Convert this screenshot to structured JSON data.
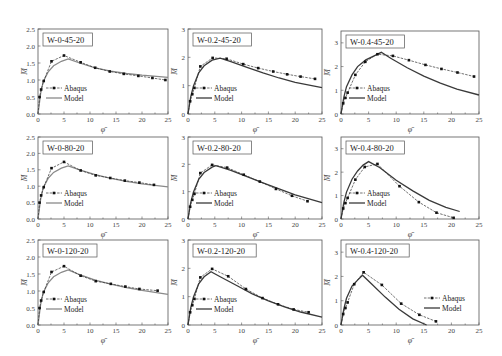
{
  "figure": {
    "legend": {
      "abaqus_label": "Abaqus",
      "model_label": "Model"
    },
    "xlabel": "φ̄",
    "ylabel": "M̄",
    "colors": {
      "abaqus": "#222222",
      "model_light": "#8a8a8a",
      "model_dark": "#3a3a3a",
      "frame": "#555555"
    }
  },
  "chart_data": [
    {
      "type": "line",
      "title": "W-0-45-20",
      "xlabel": "φ̄",
      "ylabel": "M̄",
      "xlim": [
        0,
        25
      ],
      "ylim": [
        0,
        2.5
      ],
      "xticks": [
        0,
        5,
        10,
        15,
        20,
        25
      ],
      "yticks": [
        0.0,
        0.5,
        1.0,
        1.5,
        2.0,
        2.5
      ],
      "ytick_labels": [
        "0.0",
        "0.5",
        "1.0",
        "1.5",
        "2.0",
        "2.5"
      ],
      "frame": [
        38,
        29,
        168,
        114
      ],
      "legend_pos": "lower-left",
      "model_style": "light",
      "series": [
        {
          "name": "Abaqus",
          "x": [
            0,
            0.3,
            0.6,
            1.1,
            2.6,
            5.0,
            8.2,
            11.0,
            13.8,
            16.5,
            19.3,
            22.0,
            24.5
          ],
          "y": [
            0,
            0.5,
            0.72,
            0.97,
            1.55,
            1.72,
            1.52,
            1.36,
            1.25,
            1.18,
            1.12,
            1.06,
            1.0
          ]
        },
        {
          "name": "Model",
          "x": [
            0,
            0.5,
            1.0,
            2.0,
            3.0,
            4.5,
            5.8,
            8.0,
            11.0,
            14.0,
            17.0,
            20.0,
            25.0
          ],
          "y": [
            0,
            0.6,
            0.95,
            1.25,
            1.42,
            1.55,
            1.62,
            1.5,
            1.36,
            1.26,
            1.19,
            1.14,
            1.08
          ]
        }
      ]
    },
    {
      "type": "line",
      "title": "W-0.2-45-20",
      "xlabel": "φ̄",
      "ylabel": "M̄",
      "xlim": [
        0,
        25
      ],
      "ylim": [
        0,
        3
      ],
      "xticks": [
        0,
        5,
        10,
        15,
        20,
        25
      ],
      "yticks": [
        0,
        1,
        2,
        3
      ],
      "ytick_labels": [
        "0",
        "1",
        "2",
        "3"
      ],
      "frame": [
        188,
        29,
        322,
        114
      ],
      "legend_pos": "lower-left",
      "model_style": "dark",
      "series": [
        {
          "name": "Abaqus",
          "x": [
            0,
            0.4,
            0.8,
            1.2,
            2.3,
            4.6,
            7.2,
            10.3,
            13.1,
            15.9,
            18.5,
            21.0,
            23.7
          ],
          "y": [
            0,
            0.45,
            0.7,
            0.92,
            1.68,
            1.98,
            1.95,
            1.76,
            1.62,
            1.5,
            1.4,
            1.32,
            1.24
          ]
        },
        {
          "name": "Model",
          "x": [
            0,
            0.5,
            1.0,
            2.0,
            3.0,
            4.5,
            6.0,
            8.0,
            11.0,
            14.0,
            17.0,
            20.0,
            25.0
          ],
          "y": [
            0,
            0.6,
            0.98,
            1.45,
            1.7,
            1.9,
            1.97,
            1.85,
            1.65,
            1.45,
            1.27,
            1.12,
            0.93
          ]
        }
      ]
    },
    {
      "type": "line",
      "title": "W-0.4-45-20",
      "xlabel": "φ̄",
      "ylabel": "M̄",
      "xlim": [
        0,
        25
      ],
      "ylim": [
        0,
        3.5
      ],
      "xticks": [
        0,
        5,
        10,
        15,
        20,
        25
      ],
      "yticks": [
        0,
        1,
        2,
        3
      ],
      "ytick_labels": [
        "0",
        "1",
        "2",
        "3"
      ],
      "frame": [
        341,
        31,
        479,
        114
      ],
      "legend_pos": "lower-left",
      "model_style": "dark",
      "series": [
        {
          "name": "Abaqus",
          "x": [
            0,
            0.4,
            0.8,
            1.2,
            2.6,
            4.4,
            6.6,
            9.4,
            12.3,
            15.3,
            18.2,
            21.1,
            24.1
          ],
          "y": [
            0,
            0.45,
            0.68,
            0.9,
            1.65,
            2.2,
            2.52,
            2.45,
            2.27,
            2.07,
            1.9,
            1.75,
            1.58
          ]
        },
        {
          "name": "Model",
          "x": [
            0,
            0.5,
            1.0,
            2.0,
            3.0,
            4.5,
            6.0,
            7.3,
            9.0,
            12.0,
            15.0,
            18.0,
            21.0,
            25.0
          ],
          "y": [
            0,
            0.7,
            1.15,
            1.65,
            2.0,
            2.28,
            2.45,
            2.6,
            2.35,
            1.95,
            1.6,
            1.3,
            1.05,
            0.8
          ]
        }
      ]
    },
    {
      "type": "line",
      "title": "W-0-80-20",
      "xlabel": "φ̄",
      "ylabel": "M̄",
      "xlim": [
        0,
        25
      ],
      "ylim": [
        0,
        2.5
      ],
      "xticks": [
        0,
        5,
        10,
        15,
        20,
        25
      ],
      "yticks": [
        0.0,
        0.5,
        1.0,
        1.5,
        2.0,
        2.5
      ],
      "ytick_labels": [
        "0.0",
        "0.5",
        "1.0",
        "1.5",
        "2.0",
        "2.5"
      ],
      "frame": [
        38,
        137,
        168,
        219
      ],
      "legend_pos": "lower-left",
      "model_style": "light",
      "series": [
        {
          "name": "Abaqus",
          "x": [
            0,
            0.3,
            0.6,
            1.1,
            2.6,
            5.0,
            8.2,
            11.1,
            13.9,
            16.7,
            19.5,
            22.3
          ],
          "y": [
            0,
            0.5,
            0.72,
            0.97,
            1.55,
            1.74,
            1.48,
            1.33,
            1.25,
            1.17,
            1.11,
            1.04
          ]
        },
        {
          "name": "Model",
          "x": [
            0,
            0.5,
            1.0,
            2.0,
            3.0,
            4.5,
            5.8,
            8.0,
            11.0,
            14.0,
            17.0,
            20.0,
            25.0
          ],
          "y": [
            0,
            0.6,
            0.95,
            1.25,
            1.42,
            1.55,
            1.62,
            1.5,
            1.35,
            1.24,
            1.15,
            1.07,
            0.98
          ]
        }
      ]
    },
    {
      "type": "line",
      "title": "W-0.2-80-20",
      "xlabel": "φ̄",
      "ylabel": "M̄",
      "xlim": [
        0,
        25
      ],
      "ylim": [
        0,
        3
      ],
      "xticks": [
        0,
        5,
        10,
        15,
        20,
        25
      ],
      "yticks": [
        0,
        1,
        2,
        3
      ],
      "ytick_labels": [
        "0",
        "1",
        "2",
        "3"
      ],
      "frame": [
        188,
        137,
        322,
        219
      ],
      "legend_pos": "lower-left",
      "model_style": "dark",
      "series": [
        {
          "name": "Abaqus",
          "x": [
            0,
            0.4,
            0.8,
            1.2,
            2.3,
            4.5,
            7.3,
            10.4,
            13.4,
            16.4,
            19.4,
            22.3
          ],
          "y": [
            0,
            0.45,
            0.7,
            0.92,
            1.68,
            1.98,
            1.88,
            1.62,
            1.37,
            1.1,
            0.85,
            0.65
          ]
        },
        {
          "name": "Model",
          "x": [
            0,
            0.5,
            1.0,
            2.0,
            3.0,
            4.5,
            5.2,
            8.0,
            11.0,
            14.0,
            17.0,
            20.0,
            25.0
          ],
          "y": [
            0,
            0.6,
            0.98,
            1.45,
            1.7,
            1.9,
            1.95,
            1.78,
            1.55,
            1.32,
            1.1,
            0.88,
            0.6
          ]
        }
      ]
    },
    {
      "type": "line",
      "title": "W-0.4-80-20",
      "xlabel": "φ̄",
      "ylabel": "M̄",
      "xlim": [
        0,
        25
      ],
      "ylim": [
        0,
        3.5
      ],
      "xticks": [
        0,
        5,
        10,
        15,
        20,
        25
      ],
      "yticks": [
        0,
        1,
        2,
        3
      ],
      "ytick_labels": [
        "0",
        "1",
        "2",
        "3"
      ],
      "frame": [
        341,
        137,
        479,
        219
      ],
      "legend_pos": "lower-left",
      "model_style": "dark",
      "series": [
        {
          "name": "Abaqus",
          "x": [
            0,
            0.4,
            0.8,
            1.2,
            2.6,
            4.3,
            6.6,
            10.6,
            14.1,
            17.3,
            20.4
          ],
          "y": [
            0,
            0.45,
            0.68,
            0.9,
            1.68,
            2.22,
            2.35,
            1.4,
            0.72,
            0.27,
            0.05
          ]
        },
        {
          "name": "Model",
          "x": [
            0,
            0.5,
            1.0,
            2.0,
            3.0,
            4.0,
            5.0,
            7.0,
            10.0,
            13.0,
            16.0,
            19.0,
            21.5
          ],
          "y": [
            0,
            0.7,
            1.15,
            1.7,
            2.05,
            2.3,
            2.45,
            2.2,
            1.65,
            1.2,
            0.8,
            0.5,
            0.32
          ]
        }
      ]
    },
    {
      "type": "line",
      "title": "W-0-120-20",
      "xlabel": "φ̄",
      "ylabel": "M̄",
      "xlim": [
        0,
        25
      ],
      "ylim": [
        0,
        2.5
      ],
      "xticks": [
        0,
        5,
        10,
        15,
        20,
        25
      ],
      "yticks": [
        0.0,
        0.5,
        1.0,
        1.5,
        2.0,
        2.5
      ],
      "ytick_labels": [
        "0.0",
        "0.5",
        "1.0",
        "1.5",
        "2.0",
        "2.5"
      ],
      "frame": [
        38,
        240,
        168,
        325
      ],
      "legend_pos": "lower-left",
      "model_style": "light",
      "series": [
        {
          "name": "Abaqus",
          "x": [
            0,
            0.3,
            0.6,
            1.1,
            2.6,
            5.0,
            8.2,
            11.1,
            14.0,
            16.8,
            19.5,
            23.0
          ],
          "y": [
            0,
            0.5,
            0.72,
            0.97,
            1.56,
            1.73,
            1.45,
            1.29,
            1.21,
            1.13,
            1.06,
            1.01
          ]
        },
        {
          "name": "Model",
          "x": [
            0,
            0.5,
            1.0,
            2.0,
            3.0,
            4.5,
            5.8,
            8.0,
            11.0,
            14.0,
            17.0,
            20.0,
            25.0
          ],
          "y": [
            0,
            0.6,
            0.95,
            1.25,
            1.42,
            1.55,
            1.62,
            1.48,
            1.32,
            1.2,
            1.1,
            1.02,
            0.9
          ]
        }
      ]
    },
    {
      "type": "line",
      "title": "W-0.2-120-20",
      "xlabel": "φ̄",
      "ylabel": "M̄",
      "xlim": [
        0,
        25
      ],
      "ylim": [
        0,
        3
      ],
      "xticks": [
        0,
        5,
        10,
        15,
        20,
        25
      ],
      "yticks": [
        0,
        1,
        2,
        3
      ],
      "ytick_labels": [
        "0",
        "1",
        "2",
        "3"
      ],
      "frame": [
        188,
        240,
        322,
        325
      ],
      "legend_pos": "lower-left",
      "model_style": "dark",
      "series": [
        {
          "name": "Abaqus",
          "x": [
            0,
            0.4,
            0.8,
            1.2,
            2.3,
            4.5,
            7.5,
            10.8,
            13.9,
            16.8,
            19.7,
            22.5
          ],
          "y": [
            0,
            0.45,
            0.7,
            0.92,
            1.68,
            1.98,
            1.72,
            1.27,
            0.95,
            0.73,
            0.55,
            0.45
          ]
        },
        {
          "name": "Model",
          "x": [
            0,
            0.5,
            1.0,
            2.0,
            3.0,
            4.3,
            6.0,
            9.0,
            12.0,
            15.0,
            18.0,
            21.0,
            25.0
          ],
          "y": [
            0,
            0.6,
            0.98,
            1.45,
            1.7,
            1.88,
            1.7,
            1.4,
            1.1,
            0.85,
            0.64,
            0.46,
            0.28
          ]
        }
      ]
    },
    {
      "type": "line",
      "title": "W-0.4-120-20",
      "xlabel": "φ̄",
      "ylabel": "M̄",
      "xlim": [
        0,
        25
      ],
      "ylim": [
        0,
        3.5
      ],
      "xticks": [
        0,
        5,
        10,
        15,
        20,
        25
      ],
      "yticks": [
        0,
        1,
        2,
        3
      ],
      "ytick_labels": [
        "0",
        "1",
        "2",
        "3"
      ],
      "frame": [
        341,
        240,
        479,
        325
      ],
      "legend_pos": "lower-right",
      "model_style": "dark",
      "series": [
        {
          "name": "Abaqus",
          "x": [
            0,
            0.4,
            0.8,
            1.2,
            2.4,
            4.1,
            7.4,
            10.9,
            14.2,
            17.2
          ],
          "y": [
            0,
            0.45,
            0.7,
            0.93,
            1.68,
            2.17,
            1.65,
            0.88,
            0.42,
            0.15
          ]
        },
        {
          "name": "Model",
          "x": [
            0,
            0.5,
            1.0,
            2.0,
            3.0,
            3.9,
            5.5,
            8.0,
            10.5,
            13.0,
            15.5
          ],
          "y": [
            0,
            0.65,
            1.1,
            1.6,
            1.85,
            2.05,
            1.7,
            1.15,
            0.65,
            0.25,
            0.0
          ]
        }
      ]
    }
  ]
}
